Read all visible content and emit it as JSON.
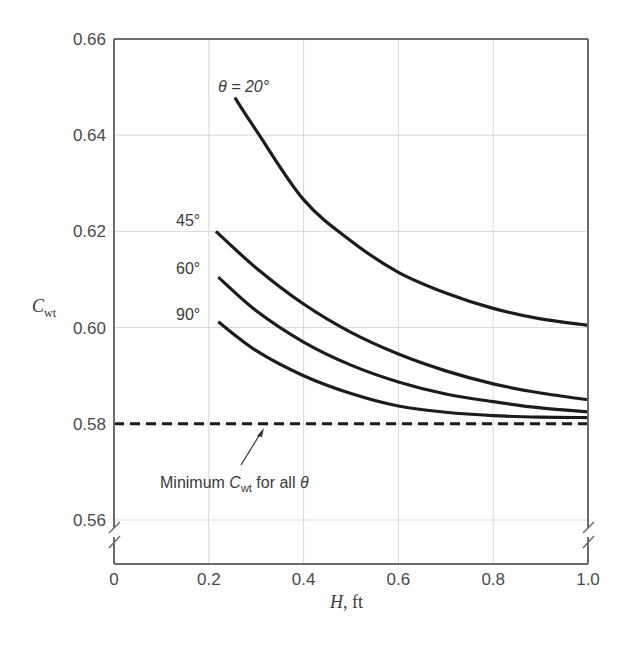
{
  "chart_data": {
    "type": "line",
    "title": "",
    "xlabel": "H, ft",
    "xlabel_parts": {
      "var": "H",
      "unit": ", ft"
    },
    "ylabel": "C_wt",
    "ylabel_parts": {
      "main": "C",
      "sub": "wt"
    },
    "xlim": [
      0,
      1.0
    ],
    "ylim": [
      0.55,
      0.66
    ],
    "y_axis_break": true,
    "grid": true,
    "x_ticks": [
      0,
      0.2,
      0.4,
      0.6,
      0.8,
      1.0
    ],
    "x_tick_labels": [
      "0",
      "0.2",
      "0.4",
      "0.6",
      "0.8",
      "1.0"
    ],
    "y_ticks": [
      0.56,
      0.58,
      0.6,
      0.62,
      0.64,
      0.66
    ],
    "y_tick_labels": [
      "0.56",
      "0.58",
      "0.60",
      "0.62",
      "0.64",
      "0.66"
    ],
    "series": [
      {
        "name": "θ = 20°",
        "label": "θ = 20°",
        "x": [
          0.255,
          0.3,
          0.4,
          0.5,
          0.6,
          0.7,
          0.8,
          0.9,
          1.0
        ],
        "y": [
          0.6478,
          0.641,
          0.6266,
          0.618,
          0.6115,
          0.6072,
          0.604,
          0.6018,
          0.6005
        ]
      },
      {
        "name": "45°",
        "label": "45°",
        "x": [
          0.215,
          0.3,
          0.4,
          0.5,
          0.6,
          0.7,
          0.8,
          0.9,
          1.0
        ],
        "y": [
          0.62,
          0.6124,
          0.6049,
          0.599,
          0.5945,
          0.591,
          0.5883,
          0.5864,
          0.585
        ]
      },
      {
        "name": "60°",
        "label": "60°",
        "x": [
          0.22,
          0.3,
          0.4,
          0.5,
          0.6,
          0.7,
          0.8,
          0.9,
          1.0
        ],
        "y": [
          0.6105,
          0.6035,
          0.597,
          0.5922,
          0.5887,
          0.5862,
          0.5846,
          0.5833,
          0.5825
        ]
      },
      {
        "name": "90°",
        "label": "90°",
        "x": [
          0.22,
          0.3,
          0.4,
          0.5,
          0.6,
          0.7,
          0.8,
          0.9,
          1.0
        ],
        "y": [
          0.6012,
          0.5952,
          0.59,
          0.5863,
          0.5837,
          0.5824,
          0.5817,
          0.5814,
          0.5813
        ]
      },
      {
        "name": "Minimum C_wt for all θ",
        "style": "dashed",
        "x": [
          0,
          1.0
        ],
        "y": [
          0.58,
          0.58
        ]
      }
    ],
    "annotations": [
      {
        "text": "Minimum C_wt for all θ",
        "parts": {
          "pre": "Minimum ",
          "var": "C",
          "sub": "wt",
          "post": " for all ",
          "theta": "θ"
        },
        "arrow_to": [
          0.31,
          0.58
        ]
      }
    ]
  }
}
